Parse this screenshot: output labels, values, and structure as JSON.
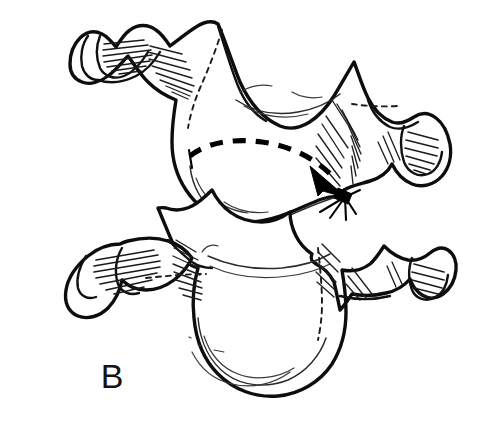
{
  "figure": {
    "panel_label": "B",
    "canvas": {
      "width": 486,
      "height": 421
    },
    "background_color": "#ffffff",
    "ink_color": "#0d0d0d",
    "style": "black and white anatomical line drawing with hatched shading"
  },
  "annotations": {
    "motion_arrow": {
      "name": "rotation-arrow",
      "style": "dashed",
      "stroke_color": "#000000",
      "start_point": {
        "x": 190,
        "y": 156
      },
      "end_point": {
        "x": 345,
        "y": 197
      },
      "arrowhead": "solid-filled",
      "direction": "left-to-right, curving down to the right"
    }
  },
  "structures": {
    "upper_vertebra": {
      "name": "upper-cervical-vertebra",
      "position": "top",
      "features": [
        "spinous process",
        "left transverse process",
        "right transverse process",
        "vertebral body",
        "articular facets"
      ]
    },
    "lower_vertebra": {
      "name": "lower-cervical-vertebra",
      "position": "bottom",
      "features": [
        "spinous process",
        "left transverse process",
        "right transverse process",
        "vertebral body"
      ]
    }
  }
}
